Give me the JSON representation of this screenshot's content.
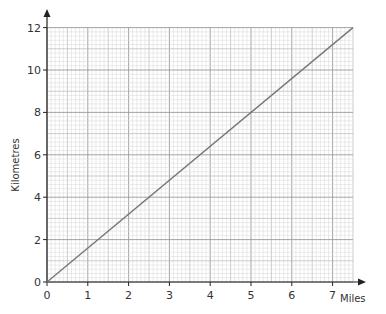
{
  "chart_data": {
    "type": "line",
    "title": "",
    "xlabel": "Miles",
    "ylabel": "Kilometres",
    "xlim": [
      0,
      7.5
    ],
    "ylim": [
      0,
      12
    ],
    "x_ticks": [
      0,
      1,
      2,
      3,
      4,
      5,
      6,
      7
    ],
    "y_ticks": [
      0,
      2,
      4,
      6,
      8,
      10,
      12
    ],
    "grid": true,
    "grid_style": "graph paper (major 1 mile / 2 km, medium 0.5 mile / 1 km, minor 0.1 mile / 0.2 km)",
    "legend": null,
    "series": [
      {
        "name": "Miles to Kilometres conversion",
        "x": [
          0,
          7.5
        ],
        "y": [
          0,
          12
        ],
        "color": "#777777"
      }
    ]
  },
  "colors": {
    "axis": "#222222",
    "grid_minor": "#d6d6d6",
    "grid_medium": "#b8b8b8",
    "grid_major": "#9a9a9a",
    "line": "#777777"
  }
}
